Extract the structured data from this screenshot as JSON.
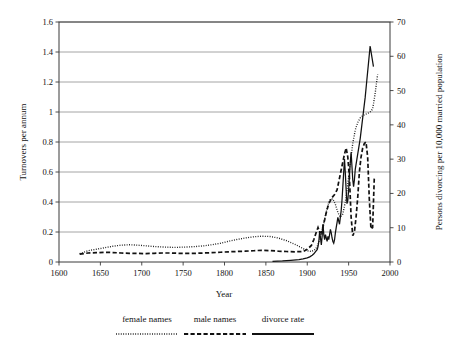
{
  "chart_data": {
    "type": "line",
    "title": "",
    "xlabel": "Year",
    "ylabel": "Turnovers per annum",
    "y2label": "Persons divorcing per 10,000 married population",
    "xlim": [
      1600,
      2000
    ],
    "ylim": [
      0,
      1.6
    ],
    "y2lim": [
      0,
      70
    ],
    "xticks": [
      1600,
      1650,
      1700,
      1750,
      1800,
      1850,
      1900,
      1950,
      2000
    ],
    "xtick_labels": [
      "1600",
      "1650",
      "1700",
      "1750",
      "1800",
      "1850",
      "1900",
      "1950",
      "2000"
    ],
    "yticks": [
      0,
      0.2,
      0.4,
      0.6,
      0.8,
      1,
      1.2,
      1.4,
      1.6
    ],
    "ytick_labels": [
      "0",
      "0.2",
      "0.4",
      "0.6",
      "0.8",
      "1",
      "1.2",
      "1.4",
      "1.6"
    ],
    "y2ticks": [
      0,
      10,
      20,
      30,
      40,
      50,
      60,
      70
    ],
    "y2tick_labels": [
      "0",
      "10",
      "20",
      "30",
      "40",
      "50",
      "60",
      "70"
    ],
    "grid": "horizontal",
    "legend_position": "below",
    "series": [
      {
        "name": "female names",
        "style": "dotted",
        "axis": "left",
        "color": "#111111",
        "x": [
          1625,
          1635,
          1645,
          1655,
          1665,
          1675,
          1685,
          1695,
          1705,
          1715,
          1725,
          1735,
          1745,
          1755,
          1765,
          1775,
          1785,
          1795,
          1805,
          1815,
          1825,
          1835,
          1845,
          1855,
          1865,
          1875,
          1885,
          1895,
          1900,
          1905,
          1910,
          1913,
          1916,
          1919,
          1922,
          1925,
          1928,
          1931,
          1934,
          1937,
          1940,
          1943,
          1946,
          1949,
          1952,
          1955,
          1958,
          1961,
          1964,
          1967,
          1970,
          1973,
          1976,
          1979,
          1982,
          1985
        ],
        "y": [
          0.055,
          0.075,
          0.085,
          0.095,
          0.105,
          0.112,
          0.115,
          0.112,
          0.108,
          0.103,
          0.1,
          0.098,
          0.098,
          0.1,
          0.103,
          0.108,
          0.115,
          0.125,
          0.138,
          0.15,
          0.16,
          0.168,
          0.172,
          0.17,
          0.16,
          0.142,
          0.118,
          0.09,
          0.075,
          0.07,
          0.085,
          0.115,
          0.17,
          0.235,
          0.31,
          0.38,
          0.42,
          0.42,
          0.385,
          0.33,
          0.3,
          0.32,
          0.4,
          0.52,
          0.66,
          0.79,
          0.88,
          0.93,
          0.96,
          0.975,
          0.985,
          0.99,
          1.0,
          1.02,
          1.12,
          1.25
        ]
      },
      {
        "name": "male names",
        "style": "dashed",
        "axis": "left",
        "color": "#111111",
        "x": [
          1625,
          1635,
          1645,
          1655,
          1665,
          1675,
          1685,
          1695,
          1705,
          1715,
          1725,
          1735,
          1745,
          1755,
          1765,
          1775,
          1785,
          1795,
          1805,
          1815,
          1825,
          1835,
          1845,
          1855,
          1865,
          1875,
          1885,
          1895,
          1900,
          1905,
          1908,
          1911,
          1913,
          1915,
          1917,
          1919,
          1921,
          1923,
          1925,
          1927,
          1930,
          1933,
          1936,
          1939,
          1942,
          1945,
          1947,
          1949,
          1951,
          1953,
          1955,
          1957,
          1959,
          1961,
          1963,
          1965,
          1967,
          1969,
          1971,
          1973,
          1975,
          1977,
          1979,
          1981
        ],
        "y": [
          0.052,
          0.06,
          0.062,
          0.065,
          0.063,
          0.06,
          0.058,
          0.057,
          0.056,
          0.058,
          0.06,
          0.06,
          0.058,
          0.057,
          0.058,
          0.06,
          0.062,
          0.065,
          0.068,
          0.07,
          0.072,
          0.075,
          0.078,
          0.076,
          0.072,
          0.07,
          0.068,
          0.07,
          0.085,
          0.11,
          0.15,
          0.2,
          0.23,
          0.2,
          0.195,
          0.235,
          0.28,
          0.33,
          0.37,
          0.4,
          0.43,
          0.45,
          0.48,
          0.56,
          0.64,
          0.72,
          0.76,
          0.7,
          0.56,
          0.3,
          0.175,
          0.2,
          0.3,
          0.43,
          0.6,
          0.7,
          0.76,
          0.79,
          0.8,
          0.7,
          0.42,
          0.22,
          0.23,
          0.56
        ]
      },
      {
        "name": "divorce rate",
        "style": "solid",
        "axis": "right",
        "color": "#111111",
        "x": [
          1858,
          1870,
          1880,
          1890,
          1895,
          1900,
          1903,
          1906,
          1908,
          1910,
          1912,
          1913,
          1914,
          1915,
          1916,
          1917,
          1918,
          1919,
          1920,
          1921,
          1922,
          1923,
          1924,
          1925,
          1926,
          1927,
          1928,
          1929,
          1930,
          1931,
          1932,
          1933,
          1934,
          1935,
          1936,
          1937,
          1938,
          1939,
          1940,
          1941,
          1942,
          1943,
          1944,
          1945,
          1946,
          1947,
          1948,
          1949,
          1950,
          1951,
          1952,
          1953,
          1954,
          1955,
          1956,
          1957,
          1958,
          1960,
          1962,
          1964,
          1966,
          1968,
          1970,
          1972,
          1974,
          1976,
          1978,
          1980
        ],
        "y": [
          0.2,
          0.3,
          0.5,
          0.7,
          0.9,
          1.2,
          1.5,
          2.0,
          2.4,
          3.0,
          3.6,
          4.5,
          6.0,
          9.0,
          7.0,
          5.0,
          7.5,
          11.0,
          8.0,
          6.5,
          8.0,
          7.0,
          6.0,
          7.5,
          6.5,
          8.0,
          9.5,
          8.5,
          7.0,
          6.0,
          5.5,
          6.5,
          8.5,
          10.0,
          11.5,
          13.0,
          12.0,
          11.0,
          13.0,
          15.0,
          18.0,
          22.0,
          26.0,
          30.0,
          26.0,
          21.0,
          17.0,
          18.0,
          21.0,
          25.0,
          29.0,
          32.0,
          28.0,
          24.0,
          22.0,
          24.0,
          27.0,
          30.0,
          33.0,
          36.0,
          40.0,
          44.0,
          48.0,
          53.0,
          58.0,
          63.0,
          60.0,
          57.0
        ]
      }
    ]
  },
  "legend": {
    "items": [
      {
        "label": "female names",
        "style": "dotted"
      },
      {
        "label": "male names",
        "style": "dashed"
      },
      {
        "label": "divorce rate",
        "style": "solid"
      }
    ]
  }
}
